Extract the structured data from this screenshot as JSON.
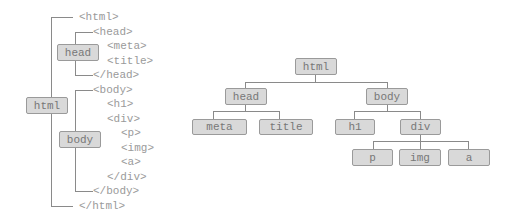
{
  "source": {
    "lines": [
      "<html>",
      "<head>",
      "<meta>",
      "<title>",
      "</head>",
      "<body>",
      "<h1>",
      "<div>",
      "<p>",
      "<img>",
      "<a>",
      "</div>",
      "</body>",
      "</html>"
    ],
    "labels": {
      "html": "html",
      "head": "head",
      "body": "body"
    }
  },
  "tree": {
    "root": "html",
    "level1": [
      "head",
      "body"
    ],
    "head_children": [
      "meta",
      "title"
    ],
    "body_children": [
      "h1",
      "div"
    ],
    "div_children": [
      "p",
      "img",
      "a"
    ]
  },
  "colors": {
    "box_fill": "#d9d9d9",
    "box_border": "#9a9a9a",
    "line": "#8a8a8a",
    "text": "#9a9a9a"
  }
}
